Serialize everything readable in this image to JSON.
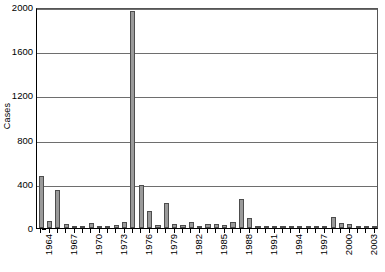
{
  "chart_data": {
    "type": "bar",
    "title": "",
    "subtitle": "",
    "xlabel": "",
    "ylabel": "Cases",
    "ylim": [
      0,
      2000
    ],
    "yticks": [
      0,
      400,
      800,
      1200,
      1600,
      2000
    ],
    "grid": true,
    "legend": false,
    "bar_color": "#9a9a9a",
    "bar_edge_color": "#4d4d4d",
    "categories": [
      "1964",
      "1965",
      "1966",
      "1967",
      "1968",
      "1969",
      "1970",
      "1971",
      "1972",
      "1973",
      "1974",
      "1975",
      "1976",
      "1977",
      "1978",
      "1979",
      "1980",
      "1981",
      "1982",
      "1983",
      "1984",
      "1985",
      "1986",
      "1987",
      "1988",
      "1989",
      "1990",
      "1991",
      "1992",
      "1993",
      "1994",
      "1995",
      "1996",
      "1997",
      "1998",
      "1999",
      "2000",
      "2001",
      "2002",
      "2003",
      "2004"
    ],
    "values": [
      470,
      60,
      340,
      35,
      20,
      18,
      45,
      12,
      15,
      30,
      55,
      1960,
      390,
      155,
      30,
      225,
      35,
      25,
      50,
      20,
      40,
      35,
      30,
      55,
      260,
      90,
      20,
      15,
      18,
      12,
      15,
      10,
      8,
      12,
      20,
      100,
      45,
      40,
      12,
      10,
      8
    ],
    "xtick_labels_shown": [
      "1964",
      "1967",
      "1970",
      "1973",
      "1976",
      "1979",
      "1982",
      "1985",
      "1988",
      "1991",
      "1994",
      "1997",
      "2000",
      "2003"
    ],
    "xtick_label_interval": 3,
    "xtick_label_rotation": -90
  }
}
